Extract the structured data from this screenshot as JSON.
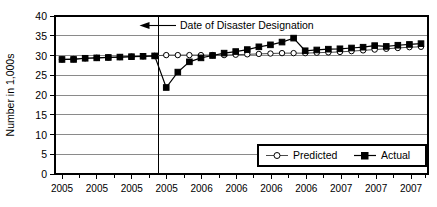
{
  "chart_data": {
    "type": "line",
    "title": "",
    "xlabel": "",
    "ylabel": "Number in 1,000s",
    "ylim": [
      0,
      40
    ],
    "yticks": [
      0,
      5,
      10,
      15,
      20,
      25,
      30,
      35,
      40
    ],
    "grid": true,
    "legend_position": "bottom-right",
    "x": [
      1,
      2,
      3,
      4,
      5,
      6,
      7,
      8,
      9,
      10,
      11,
      12,
      13,
      14,
      15,
      16,
      17,
      18,
      19,
      20,
      21,
      22,
      23,
      24,
      25,
      26,
      27,
      28,
      29,
      30,
      31,
      32
    ],
    "xtick_labels": [
      "2005",
      "2005",
      "2005",
      "2005",
      "2006",
      "2006",
      "2006",
      "2006",
      "2007",
      "2007",
      "2007"
    ],
    "series": [
      {
        "name": "Predicted",
        "marker": "open-circle",
        "values": [
          29.0,
          29.1,
          29.3,
          29.4,
          29.5,
          29.6,
          29.7,
          29.8,
          29.9,
          30.1,
          30.1,
          30.1,
          30.1,
          30.1,
          30.1,
          30.2,
          30.3,
          30.4,
          30.5,
          30.6,
          30.6,
          30.6,
          30.7,
          30.8,
          30.9,
          31.1,
          31.3,
          31.5,
          31.7,
          31.9,
          32.1,
          32.2
        ]
      },
      {
        "name": "Actual",
        "marker": "filled-square",
        "values": [
          29.0,
          29.0,
          29.3,
          29.4,
          29.5,
          29.6,
          29.7,
          29.8,
          29.9,
          21.9,
          25.8,
          28.4,
          29.4,
          30.0,
          30.6,
          31.0,
          31.5,
          32.2,
          32.7,
          33.4,
          34.4,
          31.2,
          31.4,
          31.6,
          31.7,
          31.9,
          32.1,
          32.5,
          32.3,
          32.6,
          32.8,
          33.0
        ]
      }
    ],
    "annotations": [
      {
        "text": "Date of Disaster Designation",
        "type": "arrow-left",
        "event_x": 9.3
      }
    ]
  },
  "legend": {
    "items": [
      {
        "label": "Predicted",
        "marker": "open-circle"
      },
      {
        "label": "Actual",
        "marker": "filled-square"
      }
    ]
  },
  "axes": {
    "y_title": "Number in 1,000s",
    "y_tick_0": "0",
    "y_tick_1": "5",
    "y_tick_2": "10",
    "y_tick_3": "15",
    "y_tick_4": "20",
    "y_tick_5": "25",
    "y_tick_6": "30",
    "y_tick_7": "35",
    "y_tick_8": "40",
    "x_tick_0": "2005",
    "x_tick_1": "2005",
    "x_tick_2": "2005",
    "x_tick_3": "2005",
    "x_tick_4": "2006",
    "x_tick_5": "2006",
    "x_tick_6": "2006",
    "x_tick_7": "2006",
    "x_tick_8": "2007",
    "x_tick_9": "2007",
    "x_tick_10": "2007"
  },
  "annotation": {
    "label": "Date of Disaster Designation"
  }
}
